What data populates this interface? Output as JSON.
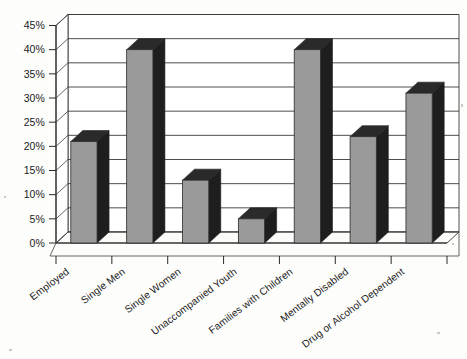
{
  "chart_data": {
    "type": "bar",
    "title": "",
    "subtitle": "",
    "xlabel": "",
    "ylabel": "",
    "ylim": [
      0,
      45
    ],
    "ytick_labels": [
      "0%",
      "5%",
      "10%",
      "15%",
      "20%",
      "25%",
      "30%",
      "35%",
      "40%",
      "45%"
    ],
    "ytick_values": [
      0,
      5,
      10,
      15,
      20,
      25,
      30,
      35,
      40,
      45
    ],
    "grid": true,
    "legend": false,
    "legend_position": "none",
    "style": "3d-column",
    "categories": [
      "Employed",
      "Single Men",
      "Single Women",
      "Unaccompanied Youth",
      "Families with Children",
      "Mentally Disabled",
      "Drug or Alcohol Dependent"
    ],
    "values": [
      21,
      40,
      13,
      5,
      40,
      22,
      31
    ],
    "value_labels": [
      "21%",
      "40%",
      "13%",
      "5%",
      "40%",
      "22%",
      "31%"
    ]
  },
  "colors": {
    "bar_front": "#9a9a9a",
    "bar_side": "#1e1e1e",
    "bar_top": "#2a2a2a",
    "grid": "#3a3a3a",
    "axis": "#2b2b2b",
    "background": "#fdfdfc",
    "text": "#1b1b1b"
  }
}
